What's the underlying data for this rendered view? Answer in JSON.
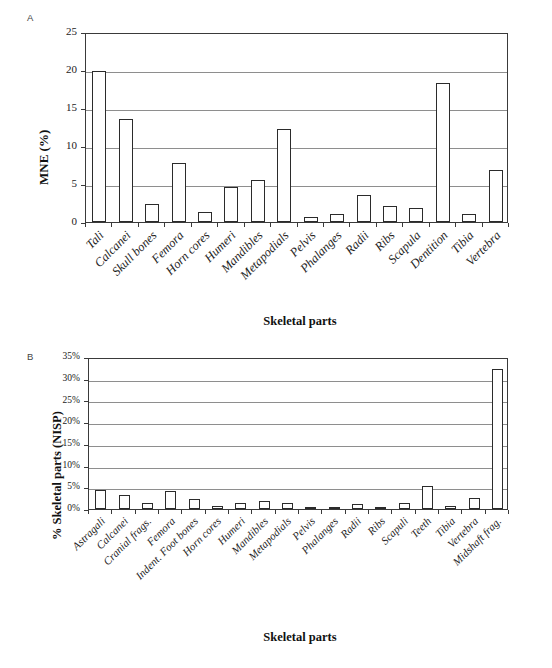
{
  "figure": {
    "panel_a_letter": "A",
    "panel_b_letter": "B"
  },
  "chart_data": [
    {
      "id": "panel-a",
      "type": "bar",
      "title": "",
      "panel_label": "A",
      "xlabel": "Skeletal parts",
      "ylabel": "MNE (%)",
      "ylim": [
        0,
        25
      ],
      "yticks": [
        0,
        5,
        10,
        15,
        20,
        25
      ],
      "ytick_labels": [
        "0",
        "5",
        "10",
        "15",
        "20",
        "25"
      ],
      "grid": true,
      "legend": "none",
      "categories": [
        "Tali",
        "Calcanei",
        "Skull bones",
        "Femora",
        "Horn cores",
        "Humeri",
        "Mandibles",
        "Metapodials",
        "Pelvis",
        "Phalanges",
        "Radii",
        "Ribs",
        "Scapula",
        "Dentition",
        "Tibia",
        "Vertebra"
      ],
      "values": [
        19.9,
        13.6,
        2.4,
        7.8,
        1.3,
        4.6,
        5.5,
        12.2,
        0.6,
        1.0,
        3.5,
        2.1,
        1.8,
        18.3,
        1.1,
        6.8
      ]
    },
    {
      "id": "panel-b",
      "type": "bar",
      "title": "",
      "panel_label": "B",
      "xlabel": "Skeletal parts",
      "ylabel": "% Skeletal parts (NISP)",
      "ylim": [
        0,
        35
      ],
      "yticks": [
        0,
        5,
        10,
        15,
        20,
        25,
        30,
        35
      ],
      "ytick_labels": [
        "0%",
        "5%",
        "10%",
        "15%",
        "20%",
        "25%",
        "30%",
        "35%"
      ],
      "grid": true,
      "legend": "none",
      "categories": [
        "Astragali",
        "Calcanei",
        "Cranial frags.",
        "Femora",
        "Indent. Foot bones",
        "Horn cores",
        "Humeri",
        "Mandibles",
        "Metapodials",
        "Pelvis",
        "Phalanges",
        "Radii",
        "Ribs",
        "Scapuli",
        "Teeth",
        "Tibia",
        "Vertebra",
        "Midshaft frag."
      ],
      "values": [
        4.4,
        3.3,
        1.5,
        4.2,
        2.2,
        0.8,
        1.4,
        1.8,
        1.4,
        0.5,
        0.5,
        1.2,
        0.5,
        1.3,
        5.2,
        0.8,
        2.5,
        32.2
      ]
    }
  ]
}
